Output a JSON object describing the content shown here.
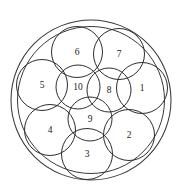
{
  "figure": {
    "name": "ten-circles-in-a-circle-packing",
    "background_color": "#ffffff",
    "stroke_color": "#2e2e2e",
    "boundary_stroke_color": "#3a3a3a",
    "label_color": "#1a1a1a",
    "width": 183,
    "height": 195
  },
  "boundary": {
    "outer": {
      "cx": 91,
      "cy": 100,
      "r": 80
    },
    "inner": {
      "cx": 91,
      "cy": 100,
      "r": 73.5
    }
  },
  "circles": [
    {
      "label": "1",
      "cx": 142,
      "cy": 88,
      "r": 25.5,
      "ring": "outer"
    },
    {
      "label": "2",
      "cx": 129,
      "cy": 135,
      "r": 25.5,
      "ring": "outer"
    },
    {
      "label": "3",
      "cx": 87,
      "cy": 154,
      "r": 25.5,
      "ring": "outer"
    },
    {
      "label": "4",
      "cx": 50,
      "cy": 130,
      "r": 25.5,
      "ring": "outer"
    },
    {
      "label": "5",
      "cx": 42,
      "cy": 85,
      "r": 25.5,
      "ring": "outer"
    },
    {
      "label": "6",
      "cx": 77,
      "cy": 52,
      "r": 25.5,
      "ring": "outer"
    },
    {
      "label": "7",
      "cx": 119,
      "cy": 54,
      "r": 25.5,
      "ring": "outer"
    },
    {
      "label": "8",
      "cx": 109,
      "cy": 90,
      "r": 22.0,
      "ring": "inner"
    },
    {
      "label": "9",
      "cx": 90,
      "cy": 119,
      "r": 22.0,
      "ring": "inner"
    },
    {
      "label": "10",
      "cx": 78,
      "cy": 87,
      "r": 22.0,
      "ring": "inner"
    }
  ],
  "chart_data": {
    "type": "diagram",
    "title": "",
    "bounding_circle": {
      "center": [
        91,
        100
      ],
      "radius": 80
    },
    "packed_circle_count": 10,
    "outer_ring_labels": [
      "1",
      "2",
      "3",
      "4",
      "5",
      "6",
      "7"
    ],
    "inner_cluster_labels": [
      "8",
      "9",
      "10"
    ]
  }
}
